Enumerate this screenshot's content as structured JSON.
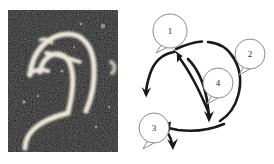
{
  "figure": {
    "type": "medical-illustration",
    "background_color": "#ffffff"
  },
  "angiogram": {
    "name": "angiogram-photograph",
    "background_color": "#0a0a0a",
    "vessel_color": "#e8e4d8",
    "frame": {
      "x": 8,
      "y": 10,
      "width": 110,
      "height": 142
    }
  },
  "schematic": {
    "name": "schematic-diagram",
    "stroke_color": "#1a1a1a",
    "callout_stroke_color": "#8a8a8a",
    "callout_fill_color": "#ffffff",
    "callouts": [
      {
        "id": "callout-1",
        "label": "1",
        "cx": 38,
        "cy": 27,
        "r": 17
      },
      {
        "id": "callout-2",
        "label": "2",
        "cx": 118,
        "cy": 50,
        "r": 15
      },
      {
        "id": "callout-3",
        "label": "3",
        "cx": 22,
        "cy": 124,
        "r": 15
      },
      {
        "id": "callout-4",
        "label": "4",
        "cx": 86,
        "cy": 79,
        "r": 15
      }
    ],
    "arrows": [
      {
        "id": "arrow-top-left-descend",
        "description": "curve from junction sweeping down-left ending in a downward arrowhead"
      },
      {
        "id": "arrow-diagonal-to-junction",
        "description": "long diagonal curve from lower right up to junction with arrowhead"
      },
      {
        "id": "arrow-outer-right-arc",
        "description": "large outer arc sweeping right and down"
      },
      {
        "id": "arrow-inner-down",
        "description": "inner curve descending with downward arrowhead"
      },
      {
        "id": "arrow-bottom-leftward",
        "description": "bottom horizontal curve running right-to-left with leftward arrowhead"
      },
      {
        "id": "arrow-hook-down",
        "description": "small hook curve ending in a down-right arrowhead"
      }
    ]
  }
}
